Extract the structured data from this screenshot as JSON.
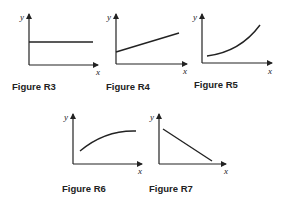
{
  "figures": [
    {
      "caption": "Figure R3",
      "y_label": "y",
      "x_label": "x",
      "shape": "horizontal constant line"
    },
    {
      "caption": "Figure R4",
      "y_label": "y",
      "x_label": "x",
      "shape": "linear increasing with positive intercept"
    },
    {
      "caption": "Figure R5",
      "y_label": "y",
      "x_label": "x",
      "shape": "convex increasing curve"
    },
    {
      "caption": "Figure R6",
      "y_label": "y",
      "x_label": "x",
      "shape": "concave increasing curve leveling off"
    },
    {
      "caption": "Figure R7",
      "y_label": "y",
      "x_label": "x",
      "shape": "linear decreasing"
    }
  ],
  "colors": {
    "line": "#222222",
    "background": "#ffffff"
  }
}
